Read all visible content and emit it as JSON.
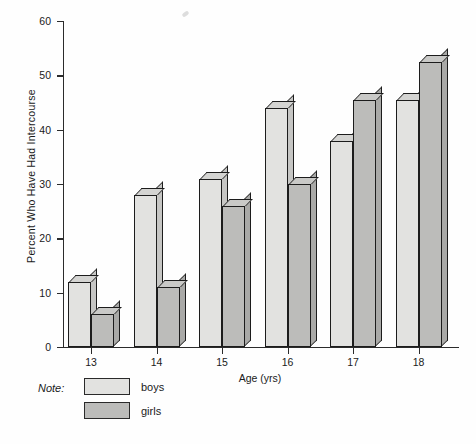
{
  "chart_data": {
    "type": "bar",
    "title": "",
    "xlabel": "Age (yrs)",
    "ylabel": "Percent Who Have Had Intercourse",
    "categories": [
      "13",
      "14",
      "15",
      "16",
      "17",
      "18"
    ],
    "series": [
      {
        "name": "boys",
        "values": [
          12,
          28,
          31,
          44,
          38,
          45.5
        ],
        "color": "#e2e2e0"
      },
      {
        "name": "girls",
        "values": [
          6,
          11,
          26,
          30,
          45.5,
          52.5
        ],
        "color": "#bcbcba"
      }
    ],
    "ylim": [
      0,
      60
    ],
    "yticks": [
      0,
      10,
      20,
      30,
      40,
      50,
      60
    ],
    "ytick_labels": [
      "0",
      "10",
      "20",
      "30",
      "40",
      "50",
      "60"
    ],
    "grid": false,
    "legend_position": "below-axes",
    "legend_prefix": "Note:",
    "style": "3d-shaded-bars"
  },
  "legend": {
    "note_label": "Note:",
    "entries": [
      {
        "label": "boys"
      },
      {
        "label": "girls"
      }
    ]
  }
}
